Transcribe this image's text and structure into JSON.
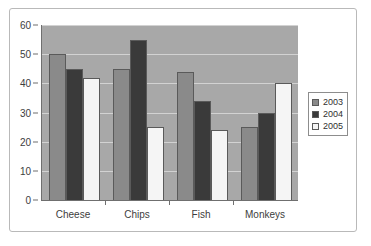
{
  "chart_data": {
    "type": "bar",
    "title": "",
    "xlabel": "",
    "ylabel": "",
    "categories": [
      "Cheese",
      "Chips",
      "Fish",
      "Monkeys"
    ],
    "series": [
      {
        "name": "2003",
        "color": "#8a8a8a",
        "values": [
          50,
          45,
          44,
          25
        ]
      },
      {
        "name": "2004",
        "color": "#3a3a3a",
        "values": [
          45,
          55,
          34,
          30
        ]
      },
      {
        "name": "2005",
        "color": "#f5f5f5",
        "values": [
          42,
          25,
          24,
          40
        ]
      }
    ],
    "ylim": [
      0,
      60
    ],
    "ytick_values": [
      0,
      10,
      20,
      30,
      40,
      50,
      60
    ],
    "ytick_labels": [
      "0",
      "10",
      "20",
      "30",
      "40",
      "50",
      "60"
    ],
    "grid": true,
    "legend_position": "right",
    "plot_background": "#a8a8a8",
    "gridline_color": "#d2d2d2",
    "axis_color": "#6f6f6f"
  },
  "legend": {
    "entries": [
      {
        "label": "2003"
      },
      {
        "label": "2004"
      },
      {
        "label": "2005"
      }
    ]
  }
}
